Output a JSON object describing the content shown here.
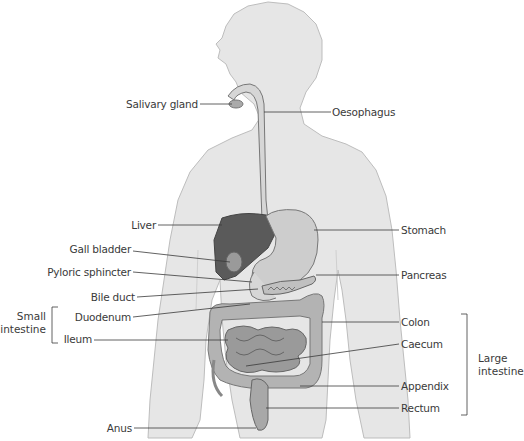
{
  "colors": {
    "body": "#e6e6e6",
    "body_outline": "#bdbdbd",
    "liver": "#5a5a5a",
    "stomach": "#c9c9c9",
    "intestine": "#9a9a9a",
    "colon": "#b3b3b3",
    "leader_line": "#3a3a3a"
  },
  "labels_left": [
    {
      "id": "salivary-gland",
      "text": "Salivary gland"
    },
    {
      "id": "liver",
      "text": "Liver"
    },
    {
      "id": "gall-bladder",
      "text": "Gall bladder"
    },
    {
      "id": "pyloric-sphincter",
      "text": "Pyloric sphincter"
    },
    {
      "id": "bile-duct",
      "text": "Bile duct"
    },
    {
      "id": "duodenum",
      "text": "Duodenum"
    },
    {
      "id": "ileum",
      "text": "Ileum"
    },
    {
      "id": "anus",
      "text": "Anus"
    }
  ],
  "labels_right": [
    {
      "id": "oesophagus",
      "text": "Oesophagus"
    },
    {
      "id": "stomach",
      "text": "Stomach"
    },
    {
      "id": "pancreas",
      "text": "Pancreas"
    },
    {
      "id": "colon",
      "text": "Colon"
    },
    {
      "id": "caecum",
      "text": "Caecum"
    },
    {
      "id": "appendix",
      "text": "Appendix"
    },
    {
      "id": "rectum",
      "text": "Rectum"
    }
  ],
  "groups": {
    "small_intestine": {
      "line1": "Small",
      "line2": "intestine"
    },
    "large_intestine": {
      "line1": "Large",
      "line2": "intestine"
    }
  }
}
